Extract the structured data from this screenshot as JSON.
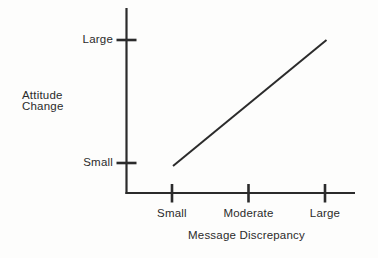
{
  "colors": {
    "ink": "#2b2b2b",
    "background": "#fdfdfc"
  },
  "chart_data": {
    "type": "line",
    "title": "",
    "xlabel": "Message Discrepancy",
    "ylabel": "Attitude Change",
    "x_categories": [
      "Small",
      "Moderate",
      "Large"
    ],
    "y_categories": [
      "Small",
      "Large"
    ],
    "grid": false,
    "legend": false,
    "series": [
      {
        "name": "attitude-change-line",
        "trend": "positive linear",
        "points": [
          {
            "x": "Small",
            "y": "Small"
          },
          {
            "x": "Large",
            "y": "Large"
          }
        ]
      }
    ]
  }
}
